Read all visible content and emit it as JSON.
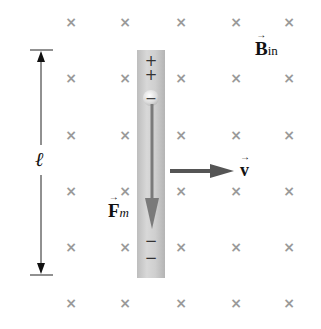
{
  "diagram": {
    "field_label": {
      "symbol": "B",
      "subscript": "in",
      "arrow": "→"
    },
    "velocity_label": {
      "symbol": "v",
      "arrow": "→"
    },
    "force_label": {
      "symbol": "F",
      "subscript": "m",
      "arrow": "→"
    },
    "length_label": "ℓ",
    "field_mark": "×",
    "rod_top_charges": [
      "+",
      "+"
    ],
    "rod_bead_charge": "−",
    "rod_bottom_charges": [
      "−",
      "−"
    ],
    "colors": {
      "field_mark": "#9a9a9a",
      "rod": "#cccccc",
      "arrow": "#555555",
      "text": "#111111"
    }
  },
  "field_grid": {
    "columns_x": [
      71,
      125,
      181,
      236,
      289
    ],
    "rows_y": [
      22,
      78,
      135,
      191,
      247,
      303
    ]
  }
}
